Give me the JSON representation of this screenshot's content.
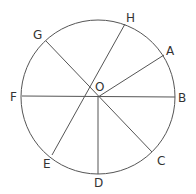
{
  "diagram": {
    "type": "circle-with-chords",
    "colors": {
      "line": "#555555",
      "text": "#333333",
      "background": "#ffffff"
    },
    "circle": {
      "cx": 98,
      "cy": 97,
      "r": 77
    },
    "center_label": {
      "text": "O",
      "x": 95,
      "y": 91
    },
    "points": [
      {
        "name": "A",
        "x": 164,
        "y": 55,
        "label_x": 166,
        "label_y": 55
      },
      {
        "name": "B",
        "x": 175,
        "y": 97,
        "label_x": 178,
        "label_y": 102
      },
      {
        "name": "C",
        "x": 152,
        "y": 152,
        "label_x": 157,
        "label_y": 165
      },
      {
        "name": "D",
        "x": 98,
        "y": 174,
        "label_x": 94,
        "label_y": 187
      },
      {
        "name": "E",
        "x": 52,
        "y": 155,
        "label_x": 43,
        "label_y": 168
      },
      {
        "name": "F",
        "x": 22,
        "y": 96,
        "label_x": 10,
        "label_y": 101
      },
      {
        "name": "G",
        "x": 46,
        "y": 41,
        "label_x": 33,
        "label_y": 39
      },
      {
        "name": "H",
        "x": 125,
        "y": 24,
        "label_x": 126,
        "label_y": 22
      }
    ],
    "segments": [
      {
        "from": "F",
        "to": "B",
        "x1": 22,
        "y1": 96,
        "x2": 175,
        "y2": 97
      },
      {
        "from": "G",
        "to": "C",
        "x1": 46,
        "y1": 41,
        "x2": 152,
        "y2": 152
      },
      {
        "from": "H",
        "to": "E",
        "x1": 125,
        "y1": 24,
        "x2": 52,
        "y2": 155
      },
      {
        "from": "O",
        "to": "A",
        "x1": 98,
        "y1": 97,
        "x2": 164,
        "y2": 55
      },
      {
        "from": "O",
        "to": "D",
        "x1": 98,
        "y1": 97,
        "x2": 98,
        "y2": 174
      }
    ]
  }
}
